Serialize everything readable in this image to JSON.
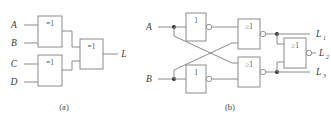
{
  "figure": {
    "type": "logic-circuit-diagram",
    "colors": {
      "background": "#ffffff",
      "wire": "#8a8a8a",
      "box_stroke": "#8a8a8a",
      "text": "#3a3a3a",
      "gate_text": "#555555",
      "junction_dot": "#2b2b2b"
    },
    "captions": {
      "a": "(a)",
      "b": "(b)"
    },
    "circuit_a": {
      "caption": "(a)",
      "inputs": [
        "A",
        "B",
        "C",
        "D"
      ],
      "outputs": [
        "L"
      ],
      "gates": [
        {
          "id": "xor1",
          "symbol": "=1",
          "type": "xor",
          "inverted": false,
          "inputs": [
            "A",
            "B"
          ]
        },
        {
          "id": "xor2",
          "symbol": "=1",
          "type": "xor",
          "inverted": false,
          "inputs": [
            "C",
            "D"
          ]
        },
        {
          "id": "xor3",
          "symbol": "=1",
          "type": "xor",
          "inverted": false,
          "inputs": [
            "xor1",
            "xor2"
          ],
          "output": "L"
        }
      ]
    },
    "circuit_b": {
      "caption": "(b)",
      "inputs": [
        "A",
        "B"
      ],
      "outputs": [
        "L",
        "L",
        "L"
      ],
      "output_labels": [
        {
          "base": "L",
          "sub": "1"
        },
        {
          "base": "L",
          "sub": "2"
        },
        {
          "base": "L",
          "sub": "3"
        }
      ],
      "gates": [
        {
          "id": "inv1",
          "symbol": "1",
          "type": "not",
          "inverted": true,
          "inputs": [
            "A"
          ]
        },
        {
          "id": "inv2",
          "symbol": "1",
          "type": "not",
          "inverted": true,
          "inputs": [
            "B"
          ]
        },
        {
          "id": "nor1",
          "symbol": "≥1",
          "type": "nor",
          "inverted": true,
          "inputs": [
            "inv1",
            "B"
          ]
        },
        {
          "id": "nor2",
          "symbol": "≥1",
          "type": "nor",
          "inverted": true,
          "inputs": [
            "A",
            "inv2"
          ]
        },
        {
          "id": "nor3",
          "symbol": "≥1",
          "type": "nor",
          "inverted": true,
          "inputs": [
            "nor1",
            "nor2"
          ]
        }
      ]
    }
  }
}
